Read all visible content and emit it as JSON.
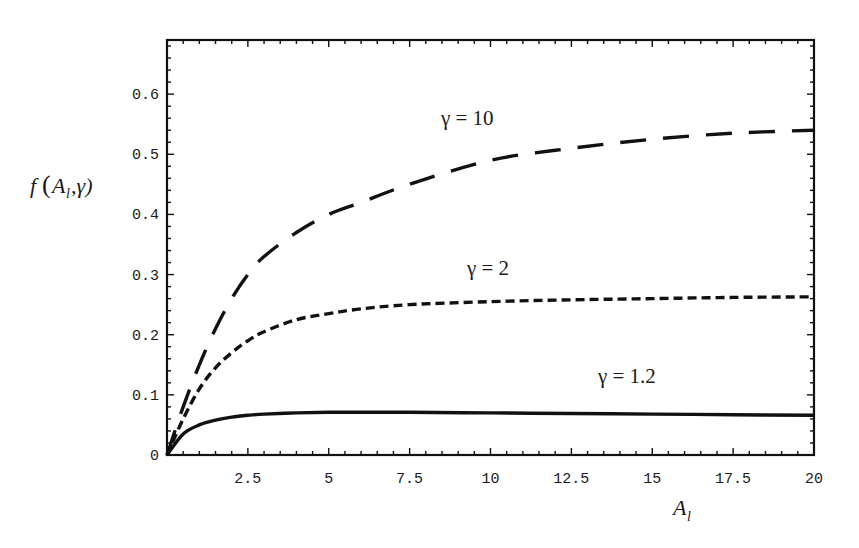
{
  "chart_data": {
    "type": "line",
    "title": "",
    "xlabel": "A_l",
    "ylabel": "f(A_l, γ)",
    "xlim": [
      0,
      20
    ],
    "ylim": [
      0,
      0.69
    ],
    "grid": false,
    "legend": "none (inline annotations)",
    "x_ticks": [
      0,
      2.5,
      5,
      7.5,
      10,
      12.5,
      15,
      17.5,
      20
    ],
    "x_tick_labels": [
      "2.5",
      "5",
      "7.5",
      "10",
      "12.5",
      "15",
      "17.5",
      "20"
    ],
    "y_ticks": [
      0,
      0.1,
      0.2,
      0.3,
      0.4,
      0.5,
      0.6
    ],
    "y_tick_labels": [
      "0",
      "0.1",
      "0.2",
      "0.3",
      "0.4",
      "0.5",
      "0.6"
    ],
    "x": [
      0,
      0.5,
      1,
      1.5,
      2,
      2.5,
      3,
      4,
      5,
      6,
      7.5,
      10,
      12.5,
      15,
      17.5,
      20
    ],
    "series": [
      {
        "name": "γ = 10",
        "style": "long-dash",
        "values": [
          0,
          0.08,
          0.15,
          0.21,
          0.26,
          0.3,
          0.33,
          0.37,
          0.4,
          0.42,
          0.45,
          0.49,
          0.51,
          0.525,
          0.535,
          0.54
        ]
      },
      {
        "name": "γ = 2",
        "style": "short-dash",
        "values": [
          0,
          0.06,
          0.11,
          0.145,
          0.17,
          0.19,
          0.205,
          0.225,
          0.235,
          0.243,
          0.25,
          0.255,
          0.258,
          0.26,
          0.262,
          0.263
        ]
      },
      {
        "name": "γ = 1.2",
        "style": "solid",
        "values": [
          0,
          0.035,
          0.05,
          0.058,
          0.063,
          0.066,
          0.068,
          0.07,
          0.071,
          0.071,
          0.071,
          0.07,
          0.069,
          0.068,
          0.067,
          0.066
        ]
      }
    ],
    "annotations": [
      {
        "text": "γ = 10",
        "x": 10,
        "y": 0.58
      },
      {
        "text": "γ = 2",
        "x": 10.5,
        "y": 0.3
      },
      {
        "text": "γ = 1.2",
        "x": 13.5,
        "y": 0.1
      }
    ]
  },
  "labels": {
    "y_axis_f": "f",
    "y_axis_open": "(",
    "y_axis_A": "A",
    "y_axis_sub": "l",
    "y_axis_rest": ",γ)",
    "x_axis_A": "A",
    "x_axis_sub": "l",
    "annot_gamma10": "γ = 10",
    "annot_gamma2": "γ = 2",
    "annot_gamma12": "γ = 1.2"
  }
}
